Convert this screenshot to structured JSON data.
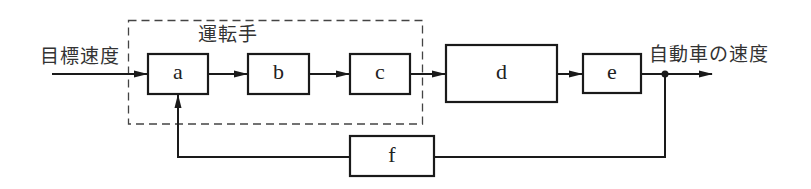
{
  "diagram": {
    "type": "block-diagram",
    "input_label": "目標速度",
    "output_label": "自動車の速度",
    "group_label": "運転手",
    "blocks": [
      {
        "id": "a",
        "label": "a"
      },
      {
        "id": "b",
        "label": "b"
      },
      {
        "id": "c",
        "label": "c"
      },
      {
        "id": "d",
        "label": "d"
      },
      {
        "id": "e",
        "label": "e"
      },
      {
        "id": "f",
        "label": "f"
      }
    ],
    "connections": [
      {
        "from": "input",
        "to": "a"
      },
      {
        "from": "a",
        "to": "b"
      },
      {
        "from": "b",
        "to": "c"
      },
      {
        "from": "c",
        "to": "d"
      },
      {
        "from": "d",
        "to": "e"
      },
      {
        "from": "e",
        "to": "output"
      },
      {
        "from": "e",
        "to": "f",
        "type": "feedback"
      },
      {
        "from": "f",
        "to": "a",
        "type": "feedback"
      }
    ],
    "group": {
      "label": "運転手",
      "contains": [
        "a",
        "b",
        "c"
      ],
      "style": "dashed"
    },
    "colors": {
      "line": "#1a1a1a",
      "background": "#ffffff"
    }
  }
}
